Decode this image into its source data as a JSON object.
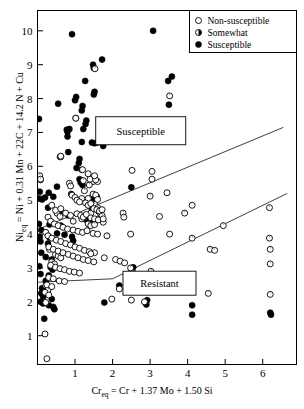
{
  "chart_data": {
    "type": "scatter",
    "title": "",
    "xlabel": "Cr_eq = Cr + 1.37 Mo + 1.50 Si",
    "ylabel": "Ni_eq = Ni + 0.31 Mn + 22C + 14.2 N + Cu",
    "xlabel_parts": {
      "pre": "Cr",
      "sub": "eq",
      "post": " = Cr + 1.37 Mo + 1.50 Si"
    },
    "ylabel_parts": {
      "pre": "Ni",
      "sub": "eq",
      "post": " = Ni + 0.31 Mn + 22C + 14.2 N + Cu"
    },
    "xlim": [
      0,
      6.9
    ],
    "ylim": [
      0.15,
      10.6
    ],
    "xticks": [
      1,
      2,
      3,
      4,
      5,
      6
    ],
    "yticks": [
      1,
      2,
      3,
      4,
      5,
      6,
      7,
      8,
      9,
      10
    ],
    "grid": false,
    "legend_position": "top-right",
    "legend": [
      {
        "label": "Non-susceptible",
        "marker": "open-circle"
      },
      {
        "label": "Somewhat",
        "marker": "half-circle"
      },
      {
        "label": "Susceptible",
        "marker": "filled-circle"
      }
    ],
    "annotations": [
      {
        "text": "Susceptible",
        "x": 2.75,
        "y": 7.05
      },
      {
        "text": "Resistant",
        "x": 3.25,
        "y": 2.55
      }
    ],
    "boundary_lines": [
      {
        "name": "susceptible-boundary",
        "points": [
          [
            0.04,
            4.15
          ],
          [
            6.55,
            7.15
          ]
        ]
      },
      {
        "name": "resistant-boundary",
        "points": [
          [
            0.02,
            2.58
          ],
          [
            2.0,
            2.68
          ],
          [
            6.65,
            5.2
          ]
        ]
      }
    ],
    "series": [
      {
        "name": "Susceptible",
        "marker": "filled-circle",
        "points": [
          [
            0.92,
            9.9
          ],
          [
            3.08,
            10.0
          ],
          [
            1.72,
            9.15
          ],
          [
            1.48,
            9.0
          ],
          [
            1.5,
            8.9
          ],
          [
            1.27,
            8.52
          ],
          [
            3.58,
            8.65
          ],
          [
            3.48,
            8.52
          ],
          [
            1.52,
            8.2
          ],
          [
            1.5,
            8.12
          ],
          [
            0.55,
            7.85
          ],
          [
            3.5,
            7.82
          ],
          [
            1.03,
            8.05
          ],
          [
            1.0,
            7.95
          ],
          [
            1.2,
            7.78
          ],
          [
            1.18,
            7.65
          ],
          [
            0.04,
            7.4
          ],
          [
            1.3,
            7.35
          ],
          [
            1.28,
            7.25
          ],
          [
            0.85,
            7.1
          ],
          [
            1.22,
            7.1
          ],
          [
            0.78,
            7.08
          ],
          [
            0.8,
            7.02
          ],
          [
            0.8,
            6.88
          ],
          [
            1.18,
            6.72
          ],
          [
            1.45,
            6.7
          ],
          [
            1.52,
            6.68
          ],
          [
            1.6,
            6.7
          ],
          [
            1.75,
            6.6
          ],
          [
            0.82,
            6.42
          ],
          [
            0.6,
            6.28
          ],
          [
            1.12,
            6.22
          ],
          [
            1.1,
            6.1
          ],
          [
            1.04,
            5.95
          ],
          [
            1.18,
            5.9
          ],
          [
            0.52,
            5.4
          ],
          [
            1.12,
            5.62
          ],
          [
            1.15,
            5.52
          ],
          [
            1.2,
            5.45
          ],
          [
            0.08,
            5.6
          ],
          [
            0.06,
            5.25
          ],
          [
            0.05,
            5.05
          ],
          [
            0.12,
            5.02
          ],
          [
            0.2,
            5.08
          ],
          [
            2.5,
            5.38
          ],
          [
            0.3,
            5.22
          ],
          [
            0.42,
            5.1
          ],
          [
            0.9,
            5.18
          ],
          [
            1.42,
            5.05
          ],
          [
            1.5,
            4.98
          ],
          [
            1.58,
            5.1
          ],
          [
            0.28,
            4.78
          ],
          [
            0.62,
            4.65
          ],
          [
            0.82,
            4.55
          ],
          [
            1.45,
            4.72
          ],
          [
            1.62,
            4.68
          ],
          [
            0.04,
            4.3
          ],
          [
            0.1,
            4.12
          ],
          [
            0.32,
            4.28
          ],
          [
            0.62,
            4.25
          ],
          [
            0.06,
            3.92
          ],
          [
            0.08,
            3.78
          ],
          [
            0.28,
            3.72
          ],
          [
            0.32,
            3.9
          ],
          [
            0.92,
            3.92
          ],
          [
            0.95,
            3.8
          ],
          [
            0.1,
            3.45
          ],
          [
            0.22,
            3.32
          ],
          [
            0.38,
            3.25
          ],
          [
            0.05,
            3.05
          ],
          [
            0.35,
            3.02
          ],
          [
            0.4,
            2.95
          ],
          [
            0.08,
            2.82
          ],
          [
            0.3,
            2.78
          ],
          [
            2.55,
            3.02
          ],
          [
            0.22,
            2.62
          ],
          [
            0.12,
            2.4
          ],
          [
            0.1,
            2.25
          ],
          [
            0.08,
            2.0
          ],
          [
            0.15,
            1.95
          ],
          [
            0.3,
            1.9
          ],
          [
            0.42,
            1.85
          ],
          [
            1.78,
            1.98
          ],
          [
            2.9,
            1.92
          ],
          [
            2.92,
            2.05
          ],
          [
            4.12,
            1.9
          ],
          [
            4.12,
            1.62
          ],
          [
            6.2,
            1.68
          ],
          [
            6.22,
            1.62
          ],
          [
            0.18,
            1.5
          ],
          [
            2.18,
            2.48
          ],
          [
            0.45,
            1.78
          ],
          [
            0.38,
            2.08
          ],
          [
            0.15,
            2.15
          ],
          [
            1.3,
            4.42
          ],
          [
            1.48,
            4.35
          ],
          [
            1.68,
            4.5
          ],
          [
            0.52,
            4.02
          ],
          [
            0.72,
            3.98
          ]
        ]
      },
      {
        "name": "Somewhat",
        "marker": "half-circle",
        "points": [
          [
            1.53,
            8.88
          ],
          [
            3.52,
            8.08
          ],
          [
            0.06,
            5.72
          ],
          [
            0.08,
            5.62
          ],
          [
            1.02,
            7.42
          ],
          [
            0.62,
            6.28
          ],
          [
            1.22,
            5.58
          ],
          [
            1.48,
            5.55
          ],
          [
            1.6,
            5.55
          ],
          [
            1.38,
            5.45
          ],
          [
            1.25,
            5.28
          ],
          [
            1.52,
            4.88
          ],
          [
            1.6,
            4.78
          ],
          [
            1.42,
            4.62
          ],
          [
            1.68,
            4.6
          ],
          [
            1.72,
            4.55
          ],
          [
            0.52,
            4.62
          ],
          [
            0.6,
            4.52
          ],
          [
            0.95,
            4.38
          ],
          [
            1.18,
            4.45
          ],
          [
            1.35,
            4.3
          ],
          [
            1.42,
            4.25
          ],
          [
            1.52,
            4.28
          ],
          [
            1.75,
            4.35
          ],
          [
            0.32,
            3.55
          ],
          [
            0.48,
            3.4
          ],
          [
            0.55,
            3.35
          ],
          [
            0.62,
            3.3
          ],
          [
            0.38,
            3.18
          ],
          [
            0.45,
            3.12
          ],
          [
            4.12,
            3.88
          ],
          [
            4.95,
            4.25
          ],
          [
            4.6,
            3.55
          ],
          [
            4.72,
            3.52
          ],
          [
            4.55,
            2.25
          ],
          [
            6.18,
            3.88
          ],
          [
            6.2,
            3.55
          ],
          [
            6.2,
            3.12
          ],
          [
            6.2,
            2.22
          ],
          [
            6.18,
            4.78
          ],
          [
            3.02,
            2.9
          ],
          [
            2.55,
            2.85
          ],
          [
            2.48,
            3.0
          ],
          [
            0.22,
            2.48
          ],
          [
            0.28,
            2.35
          ],
          [
            1.85,
            3.95
          ],
          [
            0.85,
            5.5
          ],
          [
            0.88,
            5.42
          ],
          [
            2.28,
            4.62
          ],
          [
            2.3,
            4.5
          ],
          [
            3.92,
            4.62
          ],
          [
            3.0,
            5.12
          ]
        ]
      },
      {
        "name": "Non-susceptible",
        "marker": "open-circle",
        "points": [
          [
            1.02,
            7.42
          ],
          [
            0.62,
            6.3
          ],
          [
            1.4,
            5.62
          ],
          [
            1.55,
            5.6
          ],
          [
            3.05,
            5.62
          ],
          [
            1.18,
            5.05
          ],
          [
            1.35,
            5.05
          ],
          [
            1.48,
            5.18
          ],
          [
            1.55,
            5.15
          ],
          [
            1.6,
            5.02
          ],
          [
            0.92,
            5.15
          ],
          [
            1.0,
            5.08
          ],
          [
            1.05,
            5.0
          ],
          [
            1.12,
            4.95
          ],
          [
            1.28,
            4.92
          ],
          [
            1.35,
            4.85
          ],
          [
            1.42,
            4.9
          ],
          [
            1.5,
            4.75
          ],
          [
            1.58,
            4.72
          ],
          [
            1.65,
            4.68
          ],
          [
            1.72,
            4.72
          ],
          [
            0.38,
            4.85
          ],
          [
            0.48,
            4.7
          ],
          [
            0.62,
            4.75
          ],
          [
            0.75,
            4.62
          ],
          [
            0.88,
            4.55
          ],
          [
            1.05,
            4.6
          ],
          [
            1.15,
            4.55
          ],
          [
            1.22,
            4.5
          ],
          [
            1.3,
            4.58
          ],
          [
            1.42,
            4.48
          ],
          [
            1.52,
            4.45
          ],
          [
            1.62,
            4.42
          ],
          [
            1.75,
            4.45
          ],
          [
            0.28,
            4.5
          ],
          [
            0.35,
            4.38
          ],
          [
            0.45,
            4.3
          ],
          [
            0.55,
            4.25
          ],
          [
            0.68,
            4.2
          ],
          [
            0.8,
            4.15
          ],
          [
            0.95,
            4.12
          ],
          [
            1.08,
            4.08
          ],
          [
            1.2,
            4.05
          ],
          [
            1.32,
            4.1
          ],
          [
            1.48,
            4.02
          ],
          [
            1.6,
            4.0
          ],
          [
            2.48,
            4.0
          ],
          [
            3.52,
            4.0
          ],
          [
            3.25,
            4.52
          ],
          [
            3.45,
            5.22
          ],
          [
            4.12,
            4.85
          ],
          [
            0.22,
            4.05
          ],
          [
            0.28,
            3.95
          ],
          [
            0.38,
            3.88
          ],
          [
            0.5,
            3.82
          ],
          [
            0.62,
            3.78
          ],
          [
            0.75,
            3.72
          ],
          [
            0.88,
            3.68
          ],
          [
            1.0,
            3.62
          ],
          [
            1.12,
            3.58
          ],
          [
            1.25,
            3.52
          ],
          [
            1.38,
            3.48
          ],
          [
            1.52,
            3.45
          ],
          [
            0.3,
            3.62
          ],
          [
            0.42,
            3.55
          ],
          [
            0.55,
            3.5
          ],
          [
            0.68,
            3.45
          ],
          [
            0.82,
            3.4
          ],
          [
            0.95,
            3.35
          ],
          [
            1.08,
            3.3
          ],
          [
            1.22,
            3.25
          ],
          [
            1.35,
            3.22
          ],
          [
            1.5,
            3.18
          ],
          [
            1.78,
            3.3
          ],
          [
            2.08,
            3.25
          ],
          [
            2.2,
            3.2
          ],
          [
            2.32,
            3.15
          ],
          [
            0.35,
            3.08
          ],
          [
            0.48,
            3.02
          ],
          [
            0.6,
            2.98
          ],
          [
            0.72,
            2.95
          ],
          [
            0.85,
            2.9
          ],
          [
            0.98,
            2.88
          ],
          [
            1.12,
            2.85
          ],
          [
            0.3,
            2.72
          ],
          [
            0.42,
            2.68
          ],
          [
            0.58,
            2.62
          ],
          [
            0.72,
            2.6
          ],
          [
            0.25,
            2.5
          ],
          [
            0.38,
            2.45
          ],
          [
            1.42,
            3.42
          ],
          [
            2.18,
            2.38
          ],
          [
            2.5,
            2.05
          ],
          [
            0.2,
            2.28
          ],
          [
            0.3,
            2.2
          ],
          [
            0.22,
            1.98
          ],
          [
            1.98,
            2.08
          ],
          [
            2.85,
            2.0
          ],
          [
            0.2,
            1.05
          ],
          [
            0.25,
            0.32
          ],
          [
            1.35,
            5.78
          ],
          [
            1.52,
            5.72
          ],
          [
            2.52,
            5.88
          ],
          [
            3.05,
            5.85
          ],
          [
            1.2,
            5.9
          ]
        ]
      }
    ]
  }
}
